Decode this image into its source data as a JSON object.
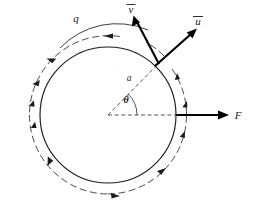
{
  "figure": {
    "background_color": "#ffffff",
    "stroke_color": "#1c1c1c",
    "width": 262,
    "height": 219,
    "labels": {
      "charge": "q",
      "velocity_v": "v",
      "velocity_u": "u",
      "radius": "a",
      "angle": "θ",
      "force": "F"
    },
    "label_positions": {
      "charge": {
        "x": 76,
        "y": 22
      },
      "velocity_v": {
        "x": 131,
        "y": 12
      },
      "velocity_u": {
        "x": 198,
        "y": 24
      },
      "radius": {
        "x": 129,
        "y": 80
      },
      "angle": {
        "x": 125,
        "y": 101
      },
      "force": {
        "x": 235,
        "y": 118
      }
    },
    "geometry": {
      "center": {
        "x": 108,
        "y": 115
      },
      "inner_radius": 68,
      "outer_radius": 79,
      "point_on_ring": {
        "x": 159,
        "y": 63
      },
      "angle_theta_degrees": 46,
      "force_vector": {
        "from_x": 176,
        "from_y": 115,
        "to_x": 228,
        "to_y": 115
      },
      "u_vector": {
        "from_x": 159,
        "from_y": 63,
        "to_x": 196,
        "to_y": 30
      },
      "v_vector": {
        "from_x": 159,
        "from_y": 63,
        "to_x": 134,
        "to_y": 17
      }
    },
    "annotations": {
      "ring_direction": "counterclockwise",
      "outer_arc_style": "dashed with arrowheads",
      "radius_line_style": "dashed",
      "force_direction": "radially outward to the right"
    }
  }
}
